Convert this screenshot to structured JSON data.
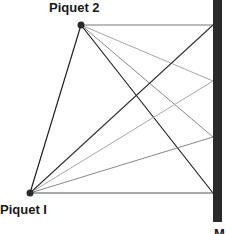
{
  "labels": {
    "piquet2": "Piquet 2",
    "piquet1": "Piquet I",
    "wall": "M"
  },
  "colors": {
    "wall": "#2a2a2a",
    "dark_line": "#222222",
    "mid_line": "#777777",
    "light_line": "#a8a8a8",
    "point": "#2a2a2a"
  },
  "points": {
    "piquet2": [
      81,
      25
    ],
    "piquet1": [
      30,
      193
    ],
    "wall_targets": [
      [
        213,
        25
      ],
      [
        213,
        81
      ],
      [
        213,
        137
      ],
      [
        213,
        193
      ]
    ]
  }
}
